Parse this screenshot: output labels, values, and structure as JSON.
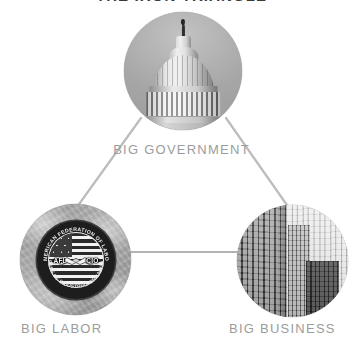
{
  "diagram": {
    "title": "THE IRON TRIANGLE",
    "type": "iron-triangle",
    "background_color": "#ffffff",
    "label_color": "#9c9c9c",
    "edge_color": "#b9b9b9",
    "nodes": [
      {
        "id": "government",
        "label": "BIG GOVERNMENT",
        "image": "us-capitol-dome-photo",
        "image_style": "grayscale-photograph-circle"
      },
      {
        "id": "labor",
        "label": "BIG LABOR",
        "image": "afl-cio-union-seal-photo",
        "image_style": "grayscale-photograph-circle",
        "seal": {
          "abbr_left": "AFL",
          "abbr_right": "CIO",
          "ring_text_top": "AMERICAN FEDERATION OF LABOR",
          "ring_text_bottom": "CONGRESS OF INDUSTRIAL ORGANIZATIONS",
          "emblem": "handshake-over-us-flag"
        }
      },
      {
        "id": "business",
        "label": "BIG BUSINESS",
        "image": "office-skyscrapers-photo",
        "image_style": "grayscale-photograph-circle"
      }
    ],
    "edges": [
      {
        "from": "government",
        "to": "labor"
      },
      {
        "from": "government",
        "to": "business"
      },
      {
        "from": "labor",
        "to": "business"
      }
    ]
  }
}
